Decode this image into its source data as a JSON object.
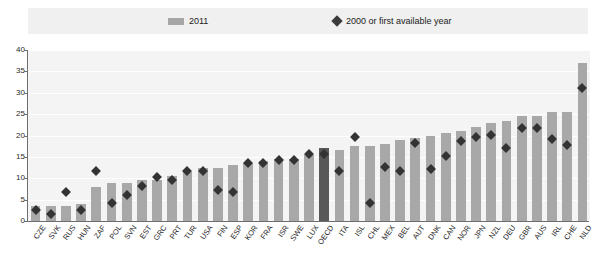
{
  "legend": {
    "items": [
      {
        "label": "2011",
        "marker": "bar-swatch",
        "color": "#a6a6a6"
      },
      {
        "label": "2000 or first available year",
        "marker": "diamond-icon",
        "color": "#3b3b3b"
      }
    ]
  },
  "axis": {
    "y_ticks": [
      "0",
      "5",
      "10",
      "15",
      "20",
      "25",
      "30",
      "35",
      "40"
    ]
  },
  "chart_data": {
    "type": "bar",
    "title": "",
    "subtitle": "",
    "xlabel": "",
    "ylabel": "",
    "ylim": [
      0,
      40
    ],
    "ytick_interval": 5,
    "grid": true,
    "legend_position": "top",
    "highlight_category": "OECD",
    "highlight_color": "#585858",
    "bar_color": "#a8a8a8",
    "marker_color": "#333333",
    "categories": [
      "CZE",
      "SVK",
      "RUS",
      "HUN",
      "ZAF",
      "POL",
      "SVN",
      "EST",
      "GRC",
      "PRT",
      "TUR",
      "USA",
      "FIN",
      "ESP",
      "KOR",
      "FRA",
      "ISR",
      "SWE",
      "LUX",
      "OECD",
      "ITA",
      "ISL",
      "CHL",
      "MEX",
      "BEL",
      "AUT",
      "DNK",
      "CAN",
      "NOR",
      "JPN",
      "NZL",
      "DEU",
      "GBR",
      "AUS",
      "IRL",
      "CHE",
      "NLD"
    ],
    "series": [
      {
        "name": "2011",
        "type": "bar",
        "values": [
          3.5,
          3.5,
          3.5,
          4.0,
          8.0,
          9.0,
          9.0,
          9.5,
          9.5,
          10.5,
          11.5,
          12.5,
          12.5,
          13.0,
          13.5,
          14.0,
          14.5,
          14.5,
          15.5,
          17.0,
          16.5,
          17.5,
          17.5,
          18.0,
          19.0,
          19.5,
          20.0,
          20.5,
          21.0,
          22.0,
          23.0,
          23.5,
          24.5,
          24.5,
          25.5,
          25.5,
          37.0
        ]
      },
      {
        "name": "2000 or first available year",
        "type": "scatter",
        "marker": "diamond",
        "values": [
          3.5,
          2.5,
          7.5,
          3.5,
          12.5,
          5.0,
          7.0,
          9.0,
          11.0,
          10.5,
          12.5,
          12.5,
          8.0,
          7.5,
          14.5,
          14.5,
          15.0,
          15.0,
          16.5,
          16.5,
          12.5,
          20.5,
          5.0,
          13.5,
          12.5,
          19.0,
          13.0,
          16.0,
          19.5,
          20.5,
          21.0,
          18.0,
          22.5,
          22.5,
          20.0,
          18.5,
          32.0
        ]
      }
    ]
  }
}
